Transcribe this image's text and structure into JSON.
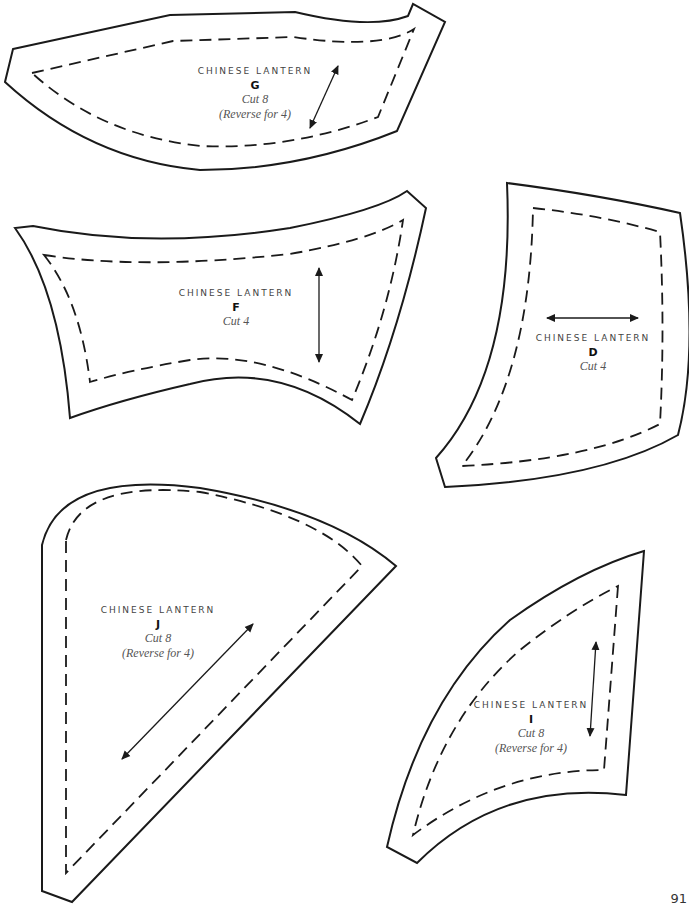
{
  "page": {
    "page_number": "91"
  },
  "pieces": [
    {
      "id": "G",
      "pattern_name": "CHINESE LANTERN",
      "letter": "G",
      "cut": "Cut 8",
      "note": "(Reverse for 4)",
      "grainline": "diagonal"
    },
    {
      "id": "F",
      "pattern_name": "CHINESE LANTERN",
      "letter": "F",
      "cut": "Cut 4",
      "note": "",
      "grainline": "vertical"
    },
    {
      "id": "D",
      "pattern_name": "CHINESE LANTERN",
      "letter": "D",
      "cut": "Cut 4",
      "note": "",
      "grainline": "horizontal"
    },
    {
      "id": "J",
      "pattern_name": "CHINESE LANTERN",
      "letter": "J",
      "cut": "Cut 8",
      "note": "(Reverse for 4)",
      "grainline": "diagonal"
    },
    {
      "id": "I",
      "pattern_name": "CHINESE LANTERN",
      "letter": "I",
      "cut": "Cut 8",
      "note": "(Reverse for 4)",
      "grainline": "vertical"
    }
  ]
}
